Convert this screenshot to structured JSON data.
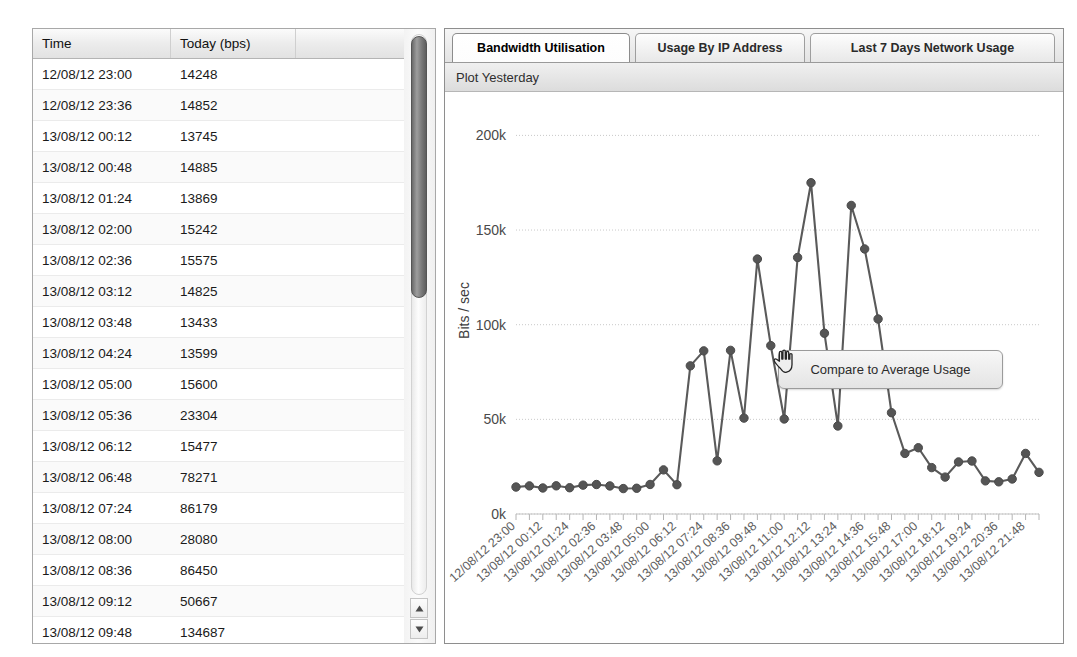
{
  "table": {
    "columns": [
      "Time",
      "Today (bps)",
      ""
    ],
    "rows": [
      {
        "time": "12/08/12 23:00",
        "bps": "14248",
        "extra": ""
      },
      {
        "time": "12/08/12 23:36",
        "bps": "14852",
        "extra": ""
      },
      {
        "time": "13/08/12 00:12",
        "bps": "13745",
        "extra": ""
      },
      {
        "time": "13/08/12 00:48",
        "bps": "14885",
        "extra": ""
      },
      {
        "time": "13/08/12 01:24",
        "bps": "13869",
        "extra": ""
      },
      {
        "time": "13/08/12 02:00",
        "bps": "15242",
        "extra": ""
      },
      {
        "time": "13/08/12 02:36",
        "bps": "15575",
        "extra": ""
      },
      {
        "time": "13/08/12 03:12",
        "bps": "14825",
        "extra": ""
      },
      {
        "time": "13/08/12 03:48",
        "bps": "13433",
        "extra": ""
      },
      {
        "time": "13/08/12 04:24",
        "bps": "13599",
        "extra": ""
      },
      {
        "time": "13/08/12 05:00",
        "bps": "15600",
        "extra": ""
      },
      {
        "time": "13/08/12 05:36",
        "bps": "23304",
        "extra": ""
      },
      {
        "time": "13/08/12 06:12",
        "bps": "15477",
        "extra": ""
      },
      {
        "time": "13/08/12 06:48",
        "bps": "78271",
        "extra": ""
      },
      {
        "time": "13/08/12 07:24",
        "bps": "86179",
        "extra": ""
      },
      {
        "time": "13/08/12 08:00",
        "bps": "28080",
        "extra": ""
      },
      {
        "time": "13/08/12 08:36",
        "bps": "86450",
        "extra": ""
      },
      {
        "time": "13/08/12 09:12",
        "bps": "50667",
        "extra": ""
      },
      {
        "time": "13/08/12 09:48",
        "bps": "134687",
        "extra": ""
      },
      {
        "time": "13/08/12 10:24",
        "bps": "88965",
        "extra": ""
      }
    ]
  },
  "scrollbar": {
    "up_arrow": "scroll-up",
    "down_arrow": "scroll-down"
  },
  "tabs": [
    {
      "label": "Bandwidth Utilisation",
      "active": true
    },
    {
      "label": "Usage By IP Address",
      "active": false
    },
    {
      "label": "Last 7 Days Network Usage",
      "active": false
    }
  ],
  "toolbar": {
    "plot_yesterday": "Plot Yesterday"
  },
  "tooltip": {
    "label": "Compare to Average Usage",
    "cursor": "pointing-hand-cursor"
  },
  "chart_data": {
    "type": "line",
    "title": "",
    "xlabel": "",
    "ylabel": "Bits / sec",
    "ylim": [
      0,
      215000
    ],
    "yticks": [
      0,
      50000,
      100000,
      150000,
      200000
    ],
    "ytick_labels": [
      "0k",
      "50k",
      "100k",
      "150k",
      "200k"
    ],
    "grid": true,
    "legend": "none",
    "marker": "circle",
    "line_color": "#5a5a5a",
    "marker_color": "#555555",
    "x": [
      "12/08/12 23:00",
      "12/08/12 23:36",
      "13/08/12 00:12",
      "13/08/12 00:48",
      "13/08/12 01:24",
      "13/08/12 02:00",
      "13/08/12 02:36",
      "13/08/12 03:12",
      "13/08/12 03:48",
      "13/08/12 04:24",
      "13/08/12 05:00",
      "13/08/12 05:36",
      "13/08/12 06:12",
      "13/08/12 06:48",
      "13/08/12 07:24",
      "13/08/12 08:00",
      "13/08/12 08:36",
      "13/08/12 09:12",
      "13/08/12 09:48",
      "13/08/12 10:24",
      "13/08/12 11:00",
      "13/08/12 11:36",
      "13/08/12 12:12",
      "13/08/12 12:48",
      "13/08/12 13:24",
      "13/08/12 14:00",
      "13/08/12 14:36",
      "13/08/12 15:12",
      "13/08/12 15:48",
      "13/08/12 16:24",
      "13/08/12 17:00",
      "13/08/12 17:36",
      "13/08/12 18:12",
      "13/08/12 18:48",
      "13/08/12 19:24",
      "13/08/12 20:00",
      "13/08/12 20:36",
      "13/08/12 21:12",
      "13/08/12 21:48",
      "13/08/12 22:24"
    ],
    "xtick_labels": [
      "12/08/12 23:00",
      "13/08/12 00:12",
      "13/08/12 01:24",
      "13/08/12 02:36",
      "13/08/12 03:48",
      "13/08/12 05:00",
      "13/08/12 06:12",
      "13/08/12 07:24",
      "13/08/12 08:36",
      "13/08/12 09:48",
      "13/08/12 11:00",
      "13/08/12 12:12",
      "13/08/12 13:24",
      "13/08/12 14:36",
      "13/08/12 15:48",
      "13/08/12 17:00",
      "13/08/12 18:12",
      "13/08/12 19:24",
      "13/08/12 20:36",
      "13/08/12 21:48"
    ],
    "values": [
      14248,
      14852,
      13745,
      14885,
      13869,
      15242,
      15575,
      14825,
      13433,
      13599,
      15600,
      23304,
      15477,
      78271,
      86179,
      28080,
      86450,
      50667,
      134687,
      88965,
      50200,
      135500,
      175000,
      95500,
      46500,
      163000,
      140000,
      103000,
      53500,
      32000,
      35000,
      24500,
      19500,
      27500,
      28000,
      17500,
      17000,
      18500,
      32000,
      22000
    ]
  }
}
